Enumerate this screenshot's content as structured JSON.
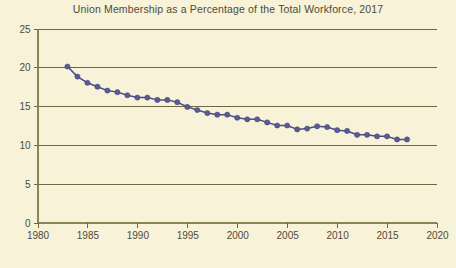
{
  "chart_data": {
    "type": "line",
    "title": "Union Membership as a Percentage of the Total Workforce, 2017",
    "xlabel": "",
    "ylabel": "",
    "xlim": [
      1980,
      2020
    ],
    "ylim": [
      0,
      25
    ],
    "xticks": [
      1980,
      1985,
      1990,
      1995,
      2000,
      2005,
      2010,
      2015,
      2020
    ],
    "yticks": [
      0,
      5,
      10,
      15,
      20,
      25
    ],
    "grid": true,
    "legend": null,
    "marker": "circle",
    "series": [
      {
        "name": "Union membership rate",
        "x": [
          1983,
          1984,
          1985,
          1986,
          1987,
          1988,
          1989,
          1990,
          1991,
          1992,
          1993,
          1994,
          1995,
          1996,
          1997,
          1998,
          1999,
          2000,
          2001,
          2002,
          2003,
          2004,
          2005,
          2006,
          2007,
          2008,
          2009,
          2010,
          2011,
          2012,
          2013,
          2014,
          2015,
          2016,
          2017
        ],
        "values": [
          20.1,
          18.8,
          18.0,
          17.5,
          17.0,
          16.8,
          16.4,
          16.1,
          16.1,
          15.8,
          15.8,
          15.5,
          14.9,
          14.5,
          14.1,
          13.9,
          13.9,
          13.5,
          13.3,
          13.3,
          12.9,
          12.5,
          12.5,
          12.0,
          12.1,
          12.4,
          12.3,
          11.9,
          11.8,
          11.3,
          11.3,
          11.1,
          11.1,
          10.7,
          10.7
        ]
      }
    ]
  },
  "axis": {
    "y_tick_labels": [
      "0",
      "5",
      "10",
      "15",
      "20",
      "25"
    ],
    "x_tick_labels": [
      "1980",
      "1985",
      "1990",
      "1995",
      "2000",
      "2005",
      "2010",
      "2015",
      "2020"
    ]
  }
}
